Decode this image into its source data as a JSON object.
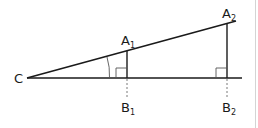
{
  "diagram": {
    "colors": {
      "line": "#1a1a1a",
      "dashed": "#7a7a7a",
      "thin": "#555555",
      "border": "#d4d4d4"
    },
    "labels": {
      "C": {
        "base": "C",
        "sub": ""
      },
      "A1": {
        "base": "A",
        "sub": "1"
      },
      "A2": {
        "base": "A",
        "sub": "2"
      },
      "B1": {
        "base": "B",
        "sub": "1"
      },
      "B2": {
        "base": "B",
        "sub": "2"
      }
    },
    "points": {
      "C": [
        27,
        78
      ],
      "A1": [
        127,
        51
      ],
      "A2": [
        227,
        24
      ],
      "B1": [
        127,
        78
      ],
      "B2": [
        227,
        78
      ],
      "hyp_end": [
        236,
        21
      ],
      "base_end": [
        242,
        78
      ]
    }
  }
}
